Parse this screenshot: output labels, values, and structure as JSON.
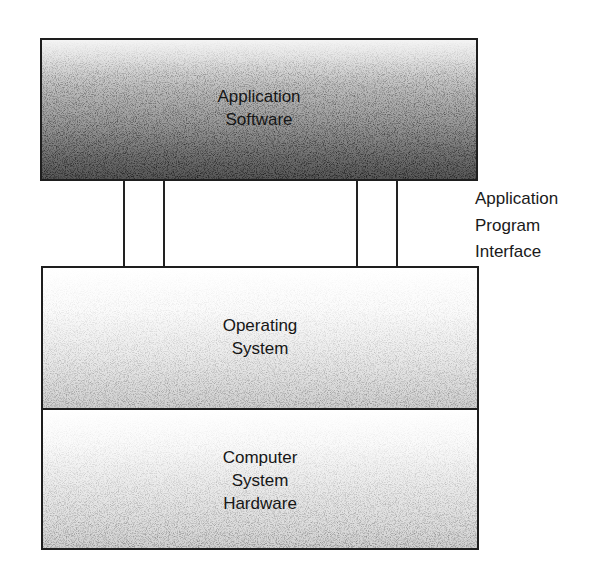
{
  "diagram": {
    "type": "layered-architecture",
    "layers": [
      {
        "id": "application-software",
        "lines": [
          "Application",
          "Software"
        ],
        "shading": "dark-gradient",
        "colors": {
          "top": "#f4f4f4",
          "bottom": "#575757"
        }
      },
      {
        "id": "operating-system",
        "lines": [
          "Operating",
          "System"
        ],
        "shading": "light-gradient",
        "colors": {
          "top": "#ffffff",
          "bottom": "#cfcfcf"
        }
      },
      {
        "id": "computer-system-hardware",
        "lines": [
          "Computer",
          "System",
          "Hardware"
        ],
        "shading": "light-gradient",
        "colors": {
          "top": "#ffffff",
          "bottom": "#d0d0d0"
        }
      }
    ],
    "interface": {
      "lines": [
        "Application",
        "Program",
        "Interface"
      ],
      "connects": [
        "application-software",
        "operating-system"
      ],
      "connector_count": 4
    },
    "border_color": "#1e1e1e"
  }
}
